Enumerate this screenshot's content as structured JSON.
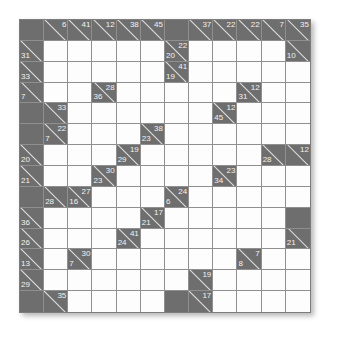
{
  "puzzle": {
    "type": "kakuro",
    "rows": 14,
    "columns": 12,
    "colors": {
      "block": "#6e6e6e",
      "open": "#fdfdfd",
      "grid_line": "#8f8f8f",
      "clue_text": "#f2f2f2",
      "slash": "#e3e3e3",
      "page_background": "#ffffff"
    },
    "legend": {
      "down_clue_position": "top-right",
      "across_clue_position": "bottom-left"
    },
    "cells": [
      [
        {
          "t": "block"
        },
        {
          "t": "clue",
          "down": "6"
        },
        {
          "t": "clue",
          "down": "41"
        },
        {
          "t": "clue",
          "down": "12"
        },
        {
          "t": "clue",
          "down": "38"
        },
        {
          "t": "clue",
          "down": "45"
        },
        {
          "t": "block"
        },
        {
          "t": "clue",
          "down": "37"
        },
        {
          "t": "clue",
          "down": "22"
        },
        {
          "t": "clue",
          "down": "22"
        },
        {
          "t": "clue",
          "down": "7"
        },
        {
          "t": "clue",
          "down": "35"
        }
      ],
      [
        {
          "t": "clue",
          "across": "31"
        },
        {
          "t": "open"
        },
        {
          "t": "open"
        },
        {
          "t": "open"
        },
        {
          "t": "open"
        },
        {
          "t": "open"
        },
        {
          "t": "clue",
          "down": "22",
          "across": "20"
        },
        {
          "t": "open"
        },
        {
          "t": "open"
        },
        {
          "t": "open"
        },
        {
          "t": "open"
        },
        {
          "t": "clue",
          "across": "10"
        }
      ],
      [
        {
          "t": "clue",
          "across": "33"
        },
        {
          "t": "open"
        },
        {
          "t": "open"
        },
        {
          "t": "open"
        },
        {
          "t": "open"
        },
        {
          "t": "open"
        },
        {
          "t": "clue",
          "down": "41",
          "across": "19"
        },
        {
          "t": "open"
        },
        {
          "t": "open"
        },
        {
          "t": "open"
        },
        {
          "t": "open"
        },
        {
          "t": "open"
        }
      ],
      [
        {
          "t": "clue",
          "across": "7"
        },
        {
          "t": "open"
        },
        {
          "t": "open"
        },
        {
          "t": "clue",
          "down": "28",
          "across": "36"
        },
        {
          "t": "open"
        },
        {
          "t": "open"
        },
        {
          "t": "open"
        },
        {
          "t": "open"
        },
        {
          "t": "open"
        },
        {
          "t": "clue",
          "down": "12",
          "across": "31"
        },
        {
          "t": "open"
        },
        {
          "t": "open"
        }
      ],
      [
        {
          "t": "block"
        },
        {
          "t": "clue",
          "down": "33"
        },
        {
          "t": "open"
        },
        {
          "t": "open"
        },
        {
          "t": "open"
        },
        {
          "t": "open"
        },
        {
          "t": "open"
        },
        {
          "t": "open"
        },
        {
          "t": "clue",
          "down": "12",
          "across": "45"
        },
        {
          "t": "open"
        },
        {
          "t": "open"
        },
        {
          "t": "open"
        }
      ],
      [
        {
          "t": "block"
        },
        {
          "t": "clue",
          "down": "22",
          "across": "7"
        },
        {
          "t": "open"
        },
        {
          "t": "open"
        },
        {
          "t": "open"
        },
        {
          "t": "clue",
          "down": "38",
          "across": "23"
        },
        {
          "t": "open"
        },
        {
          "t": "open"
        },
        {
          "t": "open"
        },
        {
          "t": "open"
        },
        {
          "t": "open"
        },
        {
          "t": "open"
        }
      ],
      [
        {
          "t": "clue",
          "across": "20"
        },
        {
          "t": "open"
        },
        {
          "t": "open"
        },
        {
          "t": "open"
        },
        {
          "t": "clue",
          "down": "19",
          "across": "29"
        },
        {
          "t": "open"
        },
        {
          "t": "open"
        },
        {
          "t": "open"
        },
        {
          "t": "open"
        },
        {
          "t": "open"
        },
        {
          "t": "clue",
          "across": "28"
        },
        {
          "t": "clue",
          "down": "12"
        }
      ],
      [
        {
          "t": "clue",
          "across": "21"
        },
        {
          "t": "open"
        },
        {
          "t": "open"
        },
        {
          "t": "clue",
          "down": "30",
          "across": "23"
        },
        {
          "t": "open"
        },
        {
          "t": "open"
        },
        {
          "t": "open"
        },
        {
          "t": "open"
        },
        {
          "t": "clue",
          "down": "23",
          "across": "34"
        },
        {
          "t": "open"
        },
        {
          "t": "open"
        },
        {
          "t": "open"
        }
      ],
      [
        {
          "t": "block"
        },
        {
          "t": "clue",
          "across": "28"
        },
        {
          "t": "clue",
          "down": "27",
          "across": "16"
        },
        {
          "t": "open"
        },
        {
          "t": "open"
        },
        {
          "t": "open"
        },
        {
          "t": "clue",
          "down": "24",
          "across": "6"
        },
        {
          "t": "open"
        },
        {
          "t": "open"
        },
        {
          "t": "open"
        },
        {
          "t": "open"
        },
        {
          "t": "open"
        }
      ],
      [
        {
          "t": "clue",
          "across": "36"
        },
        {
          "t": "open"
        },
        {
          "t": "open"
        },
        {
          "t": "open"
        },
        {
          "t": "open"
        },
        {
          "t": "clue",
          "down": "17",
          "across": "21"
        },
        {
          "t": "open"
        },
        {
          "t": "open"
        },
        {
          "t": "open"
        },
        {
          "t": "open"
        },
        {
          "t": "open"
        },
        {
          "t": "block"
        }
      ],
      [
        {
          "t": "clue",
          "across": "26"
        },
        {
          "t": "open"
        },
        {
          "t": "open"
        },
        {
          "t": "open"
        },
        {
          "t": "clue",
          "down": "41",
          "across": "24"
        },
        {
          "t": "open"
        },
        {
          "t": "open"
        },
        {
          "t": "open"
        },
        {
          "t": "open"
        },
        {
          "t": "open"
        },
        {
          "t": "open"
        },
        {
          "t": "clue",
          "across": "21"
        }
      ],
      [
        {
          "t": "clue",
          "across": "13"
        },
        {
          "t": "open"
        },
        {
          "t": "clue",
          "down": "30",
          "across": "7"
        },
        {
          "t": "open"
        },
        {
          "t": "open"
        },
        {
          "t": "open"
        },
        {
          "t": "open"
        },
        {
          "t": "open"
        },
        {
          "t": "open"
        },
        {
          "t": "clue",
          "down": "7",
          "across": "8"
        },
        {
          "t": "open"
        },
        {
          "t": "open"
        }
      ],
      [
        {
          "t": "clue",
          "across": "29"
        },
        {
          "t": "open"
        },
        {
          "t": "open"
        },
        {
          "t": "open"
        },
        {
          "t": "open"
        },
        {
          "t": "open"
        },
        {
          "t": "open"
        },
        {
          "t": "clue",
          "down": "19"
        },
        {
          "t": "open"
        },
        {
          "t": "open"
        },
        {
          "t": "open"
        },
        {
          "t": "open"
        }
      ],
      [
        {
          "t": "block"
        },
        {
          "t": "clue",
          "down": "35"
        },
        {
          "t": "open"
        },
        {
          "t": "open"
        },
        {
          "t": "open"
        },
        {
          "t": "open"
        },
        {
          "t": "block"
        },
        {
          "t": "clue",
          "down": "17"
        },
        {
          "t": "open"
        },
        {
          "t": "open"
        },
        {
          "t": "open"
        },
        {
          "t": "open"
        }
      ]
    ]
  }
}
